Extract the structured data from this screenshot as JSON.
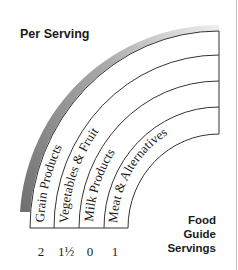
{
  "title": "Per Serving",
  "side_label": {
    "line1": "Food",
    "line2": "Guide",
    "line3": "Servings"
  },
  "bands": [
    {
      "label": "Grain Products",
      "servings": "2"
    },
    {
      "label": "Vegetables & Fruit",
      "servings": "1½"
    },
    {
      "label": "Milk Products",
      "servings": "0"
    },
    {
      "label": "Meat & Alternatives",
      "servings": "1"
    }
  ],
  "colors": {
    "outer_band": "#8a8a8a",
    "lines": "#333333"
  }
}
